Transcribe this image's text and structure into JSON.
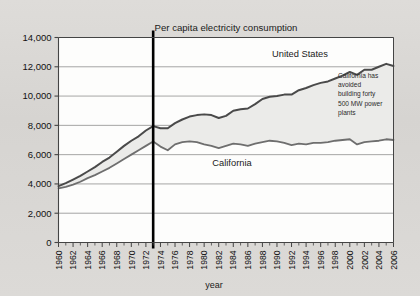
{
  "chart_data": {
    "type": "line",
    "title": "Per capita electricity consumption",
    "xlabel": "year",
    "ylabel": "",
    "xlim": [
      1960,
      2006
    ],
    "ylim": [
      0,
      14000
    ],
    "grid": true,
    "legend_position": "inline-annotations",
    "ytick_labels": [
      "0",
      "2,000",
      "4,000",
      "6,000",
      "8,000",
      "10,000",
      "12,000",
      "14,000"
    ],
    "ytick_values": [
      0,
      2000,
      4000,
      6000,
      8000,
      10000,
      12000,
      14000
    ],
    "xtick_labels": [
      "1960",
      "1962",
      "1964",
      "1966",
      "1968",
      "1970",
      "1972",
      "1974",
      "1976",
      "1978",
      "1980",
      "1982",
      "1984",
      "1986",
      "1988",
      "1990",
      "1992",
      "1994",
      "1996",
      "1998",
      "2000",
      "2002",
      "2004",
      "2006"
    ],
    "xtick_values": [
      1960,
      1962,
      1964,
      1966,
      1968,
      1970,
      1972,
      1974,
      1976,
      1978,
      1980,
      1982,
      1984,
      1986,
      1988,
      1990,
      1992,
      1994,
      1996,
      1998,
      2000,
      2002,
      2004,
      2006
    ],
    "x": [
      1960,
      1961,
      1962,
      1963,
      1964,
      1965,
      1966,
      1967,
      1968,
      1969,
      1970,
      1971,
      1972,
      1973,
      1974,
      1975,
      1976,
      1977,
      1978,
      1979,
      1980,
      1981,
      1982,
      1983,
      1984,
      1985,
      1986,
      1987,
      1988,
      1989,
      1990,
      1991,
      1992,
      1993,
      1994,
      1995,
      1996,
      1997,
      1998,
      1999,
      2000,
      2001,
      2002,
      2003,
      2004,
      2005,
      2006
    ],
    "series": [
      {
        "name": "United States",
        "color": "#4a4a4a",
        "values": [
          3850,
          4050,
          4300,
          4550,
          4850,
          5150,
          5500,
          5800,
          6200,
          6600,
          6950,
          7250,
          7650,
          7950,
          7800,
          7800,
          8150,
          8400,
          8600,
          8700,
          8750,
          8700,
          8500,
          8650,
          9000,
          9100,
          9150,
          9450,
          9800,
          9950,
          10000,
          10100,
          10100,
          10400,
          10550,
          10750,
          10900,
          11000,
          11200,
          11400,
          11650,
          11450,
          11800,
          11800,
          12000,
          12200,
          12050
        ]
      },
      {
        "name": "California",
        "color": "#6e6e6e",
        "values": [
          3700,
          3800,
          3950,
          4150,
          4400,
          4600,
          4850,
          5100,
          5400,
          5700,
          6000,
          6300,
          6600,
          6900,
          6550,
          6300,
          6700,
          6850,
          6900,
          6850,
          6700,
          6600,
          6450,
          6600,
          6750,
          6700,
          6600,
          6750,
          6850,
          6950,
          6900,
          6800,
          6650,
          6750,
          6700,
          6800,
          6800,
          6850,
          6950,
          7000,
          7050,
          6700,
          6850,
          6900,
          6950,
          7050,
          7000
        ]
      }
    ],
    "marker_line": {
      "year": 1973,
      "color": "#000000"
    },
    "annotations": [
      {
        "name": "us-series-label",
        "text": "United States"
      },
      {
        "name": "california-series-label",
        "text": "California"
      },
      {
        "name": "avoided-plants-note",
        "lines": [
          "California has",
          "avoided",
          "building forty",
          "500 MW power",
          "plants"
        ]
      }
    ]
  }
}
